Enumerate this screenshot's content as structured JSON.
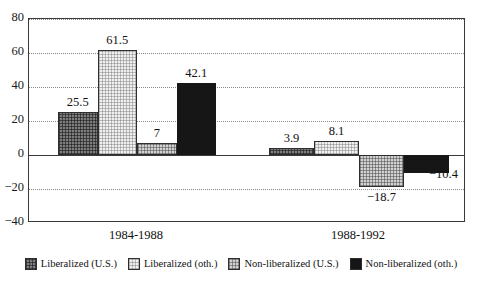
{
  "chart_data": {
    "type": "bar",
    "title": "",
    "subtitle": "",
    "xlabel": "",
    "ylabel": "",
    "categories": [
      "1984-1988",
      "1988-1992"
    ],
    "ylim": [
      -40,
      80
    ],
    "yticks": [
      80,
      60,
      40,
      20,
      0,
      -20,
      -40
    ],
    "ytick_labels": [
      "80",
      "60",
      "40",
      "20",
      "0",
      "−20",
      "−40"
    ],
    "grid": "horizontal dotted gridlines at every 20; solid line at 0",
    "legend_position": "bottom-center",
    "series": [
      {
        "name": "Liberalized (U.S.)",
        "pattern": "dark-grey-crosshatch",
        "color": "#7d7d7d",
        "values": [
          25.5,
          3.9
        ],
        "labels": [
          "25.5",
          "3.9"
        ]
      },
      {
        "name": "Liberalized (oth.)",
        "pattern": "light-crosshatch",
        "color": "#f0f0f0",
        "values": [
          61.5,
          8.1
        ],
        "labels": [
          "61.5",
          "8.1"
        ]
      },
      {
        "name": "Non-liberalized (U.S.)",
        "pattern": "mid-grey-crosshatch",
        "color": "#d2d2d2",
        "values": [
          7,
          -18.7
        ],
        "labels": [
          "7",
          "−18.7"
        ]
      },
      {
        "name": "Non-liberalized (oth.)",
        "pattern": "solid-black",
        "color": "#161616",
        "values": [
          42.1,
          -10.4
        ],
        "labels": [
          "42.1",
          "−10.4"
        ]
      }
    ]
  },
  "axis": {
    "y_labels": [
      "80",
      "60",
      "40",
      "20",
      "0",
      "−20",
      "−40"
    ]
  },
  "legend": {
    "items": [
      {
        "label": "Liberalized (U.S.)",
        "swatch": "pat-lib-us"
      },
      {
        "label": "Liberalized (oth.)",
        "swatch": "pat-lib-oth"
      },
      {
        "label": "Non-liberalized (U.S.)",
        "swatch": "pat-nonlib-us"
      },
      {
        "label": "Non-liberalized (oth.)",
        "swatch": "pat-nonlib-oth"
      }
    ]
  },
  "x_categories": [
    "1984-1988",
    "1988-1992"
  ]
}
